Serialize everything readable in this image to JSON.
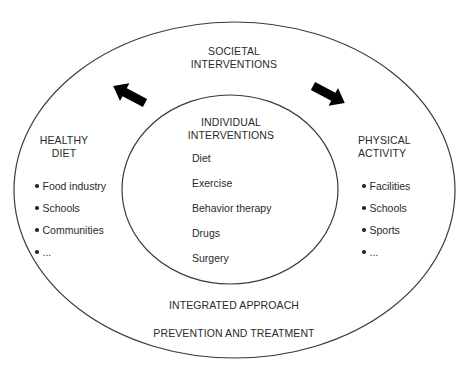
{
  "diagram": {
    "outer_circle": {
      "title_line1": "SOCIETAL",
      "title_line2": "INTERVENTIONS",
      "footer_line1": "INTEGRATED APPROACH",
      "footer_line2": "PREVENTION AND TREATMENT"
    },
    "inner_circle": {
      "title_line1": "INDIVIDUAL",
      "title_line2": "INTERVENTIONS",
      "items": [
        "Diet",
        "Exercise",
        "Behavior therapy",
        "Drugs",
        "Surgery"
      ]
    },
    "left_group": {
      "title_line1": "HEALTHY",
      "title_line2": "DIET",
      "items": [
        "Food industry",
        "Schools",
        "Communities",
        "..."
      ]
    },
    "right_group": {
      "title_line1": "PHYSICAL",
      "title_line2": "ACTIVITY",
      "items": [
        "Facilities",
        "Schools",
        "Sports",
        "..."
      ]
    },
    "arrows": [
      {
        "name": "arrow-to-healthy-diet",
        "direction": "down-left"
      },
      {
        "name": "arrow-to-physical-activity",
        "direction": "down-right"
      }
    ],
    "colors": {
      "stroke": "#3a3a3a",
      "text": "#2a2a2a",
      "arrow": "#000000",
      "background": "#ffffff"
    }
  }
}
